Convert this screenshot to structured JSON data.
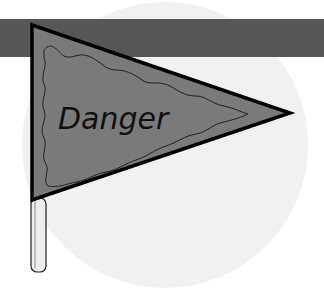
{
  "image": {
    "description": "Clipart of a gray pennant flag on a pole reading Danger",
    "flag_text": "Danger",
    "colors": {
      "background": "#ffffff",
      "circle": "#f1f1f1",
      "band": "#575757",
      "flag_fill": "#7a7a7a",
      "outline": "#000000",
      "pole": "#e8e8e8"
    }
  }
}
